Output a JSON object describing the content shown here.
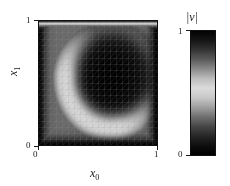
{
  "figure": {
    "kind": "velocity-magnitude-field"
  },
  "axes": {
    "xlabel": "x₀",
    "xlabel_base": "x",
    "xlabel_sub": "0",
    "ylabel": "x₁",
    "ylabel_base": "x",
    "ylabel_sub": "1",
    "xticks": [
      "0",
      "1"
    ],
    "yticks": [
      "0",
      "1"
    ],
    "xlim": [
      0,
      1
    ],
    "ylim": [
      0,
      1
    ]
  },
  "colorbar": {
    "title": "|v|",
    "title_left_bar": "|",
    "title_symbol": "v",
    "title_right_bar": "|",
    "ticks": [
      "1",
      "0"
    ],
    "tick_high": "1",
    "tick_low": "0",
    "vmin": 0,
    "vmax": 1,
    "colormap": "grayscale-viridis"
  },
  "colors": {
    "background": "#ffffff",
    "text": "#1a1a1a",
    "frame": "#111111",
    "mesh_line": "rgba(150,150,150,0.30)",
    "cmap_stops": [
      "#000000",
      "#0d0d0d",
      "#252525",
      "#454545",
      "#6e6e6e",
      "#9e9e9e",
      "#c8c8c8",
      "#dcdcdc",
      "#bdbdbd",
      "#8a8a8a",
      "#5a5a5a",
      "#323232",
      "#141414",
      "#020202"
    ]
  },
  "chart_data": {
    "type": "heatmap",
    "title": "",
    "xlabel": "x0",
    "ylabel": "x1",
    "xlim": [
      0,
      1
    ],
    "ylim": [
      0,
      1
    ],
    "clim": [
      0,
      1
    ],
    "colorbar_label": "|v|",
    "grid": "triangular-mesh-overlay",
    "mesh_divisions": 20,
    "legend": "colorbar-right",
    "field": "velocity magnitude |v| of a lid-driven cavity flow; top lid moves with |v| = 1 producing a bright top strip, a bright crescent-shaped shear band sweeps down the left wall and along the bottom, the vortex core near the centre-right is dark (|v| near 0)",
    "notable_values": [
      {
        "region": "top lid (x1 = 1)",
        "value": 1.0
      },
      {
        "region": "vortex core (~x0 = 0.6, x1 = 0.55)",
        "value": 0.02
      },
      {
        "region": "left shear band (~x0 = 0.18, x1 = 0.55)",
        "value": 0.42
      },
      {
        "region": "bottom-left corner",
        "value": 0.02
      },
      {
        "region": "bottom-right corner",
        "value": 0.02
      },
      {
        "region": "right shear band (~x0 = 0.9, x1 = 0.6)",
        "value": 0.38
      }
    ]
  }
}
